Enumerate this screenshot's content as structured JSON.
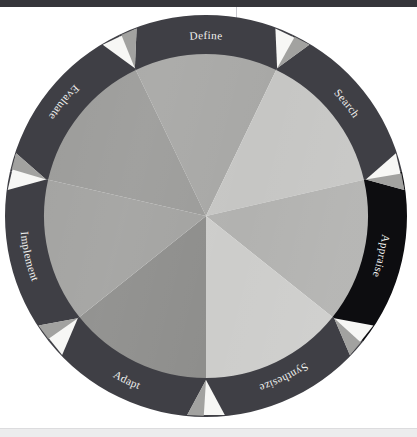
{
  "figure": {
    "type": "cycle-wheel-diagram",
    "title": "",
    "center": {
      "x": 206,
      "y": 216
    },
    "outer_radius": 201,
    "inner_radius": 162,
    "segment_count": 7
  },
  "colors": {
    "page_background": "#ffffff",
    "top_bar": "#35353a",
    "bottom_band": "#ececed",
    "ring_default": "#3f3f45",
    "ring_highlight": "#0d0d10",
    "ring_label_text": "#f2f2f0",
    "arrow_marker_light": "#f7f7f5",
    "arrow_marker_gray": "#9a9a98",
    "wedge_palette": [
      "#9c9c9a",
      "#c6c6c4",
      "#b2b2b0",
      "#cdcdcb",
      "#8e8e8c",
      "#a3a3a1",
      "#a8a8a6"
    ]
  },
  "ring": {
    "segments": [
      {
        "label": "Define",
        "start_angle": -25.7,
        "end_angle": 25.7,
        "highlight": false,
        "wedge_color": "#a8a8a6",
        "arrow_at_start": true
      },
      {
        "label": "Search",
        "start_angle": 25.7,
        "end_angle": 77.1,
        "highlight": false,
        "wedge_color": "#c6c6c4",
        "arrow_at_start": true
      },
      {
        "label": "Appraise",
        "start_angle": 77.1,
        "end_angle": 128.6,
        "highlight": true,
        "wedge_color": "#b2b2b0",
        "arrow_at_start": true
      },
      {
        "label": "Synthesize",
        "start_angle": 128.6,
        "end_angle": 180.0,
        "highlight": false,
        "wedge_color": "#cdcdcb",
        "arrow_at_start": true
      },
      {
        "label": "Adapt",
        "start_angle": 180.0,
        "end_angle": 231.4,
        "highlight": false,
        "wedge_color": "#8e8e8c",
        "arrow_at_start": true
      },
      {
        "label": "Implement",
        "start_angle": 231.4,
        "end_angle": 282.9,
        "highlight": false,
        "wedge_color": "#a3a3a1",
        "arrow_at_start": true
      },
      {
        "label": "Evaluate",
        "start_angle": 282.9,
        "end_angle": 334.3,
        "highlight": false,
        "wedge_color": "#9c9c9a",
        "arrow_at_start": true
      }
    ]
  },
  "chart_data": {
    "type": "pie",
    "title": "",
    "xlabel": "",
    "ylabel": "",
    "categories": [
      "Define",
      "Search",
      "Appraise",
      "Synthesize",
      "Adapt",
      "Implement",
      "Evaluate"
    ],
    "values": [
      51.4,
      51.4,
      51.4,
      51.4,
      51.4,
      51.4,
      51.4
    ],
    "legend_position": "ring-labels",
    "grid": false,
    "annotations": [
      "Seven equal stages arranged as a clockwise cycle",
      "Appraise segment is emphasised in near-black",
      "Light triangular arrow markers sit at every stage boundary"
    ]
  }
}
